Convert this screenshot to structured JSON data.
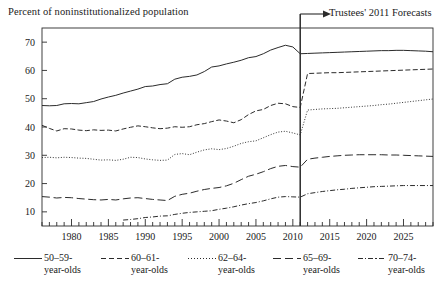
{
  "chart_data": {
    "type": "line",
    "title": "Percent of noninstitutionalized population",
    "xlabel": "",
    "ylabel": "Percent of noninstitutionalized population",
    "xlim": [
      1976,
      2029
    ],
    "ylim": [
      5,
      75
    ],
    "yticks": [
      10,
      20,
      30,
      40,
      50,
      60,
      70
    ],
    "xticks": [
      1980,
      1985,
      1990,
      1995,
      2000,
      2005,
      2010,
      2015,
      2020,
      2025
    ],
    "minor_xtick_interval": 1,
    "grid": false,
    "legend_position": "below",
    "annotations": [
      {
        "text": "Trustees' 2011 Forecasts",
        "x": 2011,
        "type": "arrow-right",
        "target_x": 2011
      }
    ],
    "forecast_divider_x": 2011,
    "series": [
      {
        "name": "50–59-year-olds",
        "label_line1": "50–59-",
        "label_line2": "year-olds",
        "style": "solid",
        "x": [
          1976,
          1977,
          1978,
          1979,
          1980,
          1981,
          1982,
          1983,
          1984,
          1985,
          1986,
          1987,
          1988,
          1989,
          1990,
          1991,
          1992,
          1993,
          1994,
          1995,
          1996,
          1997,
          1998,
          1999,
          2000,
          2001,
          2002,
          2003,
          2004,
          2005,
          2006,
          2007,
          2008,
          2009,
          2010,
          2011,
          2012,
          2013,
          2014,
          2015,
          2016,
          2017,
          2018,
          2019,
          2020,
          2021,
          2022,
          2023,
          2024,
          2025,
          2026,
          2027,
          2028,
          2029
        ],
        "y": [
          47.6,
          47.5,
          47.6,
          48.2,
          48.3,
          48.2,
          48.6,
          49.0,
          49.9,
          50.6,
          51.2,
          52.0,
          52.7,
          53.4,
          54.3,
          54.5,
          55.0,
          55.3,
          56.9,
          57.6,
          57.9,
          58.4,
          59.6,
          61.2,
          61.6,
          62.3,
          62.9,
          63.6,
          64.5,
          64.9,
          65.9,
          67.2,
          68.1,
          68.9,
          68.3,
          65.9,
          66.0,
          66.1,
          66.2,
          66.3,
          66.4,
          66.5,
          66.6,
          66.7,
          66.8,
          66.9,
          67.0,
          67.0,
          67.1,
          67.1,
          67.0,
          66.9,
          66.8,
          66.6
        ]
      },
      {
        "name": "60–61-year-olds",
        "label_line1": "60–61-",
        "label_line2": "year-olds",
        "style": "dashed",
        "x": [
          1976,
          1977,
          1978,
          1979,
          1980,
          1981,
          1982,
          1983,
          1984,
          1985,
          1986,
          1987,
          1988,
          1989,
          1990,
          1991,
          1992,
          1993,
          1994,
          1995,
          1996,
          1997,
          1998,
          1999,
          2000,
          2001,
          2002,
          2003,
          2004,
          2005,
          2006,
          2007,
          2008,
          2009,
          2010,
          2011,
          2012,
          2013,
          2014,
          2015,
          2016,
          2017,
          2018,
          2019,
          2020,
          2021,
          2022,
          2023,
          2024,
          2025,
          2026,
          2027,
          2028,
          2029
        ],
        "y": [
          40.6,
          39.5,
          38.6,
          39.4,
          39.3,
          38.9,
          38.7,
          39.0,
          38.8,
          38.9,
          38.6,
          39.3,
          39.9,
          40.4,
          40.1,
          39.7,
          39.4,
          39.6,
          40.1,
          39.9,
          40.1,
          40.8,
          41.2,
          41.9,
          42.5,
          42.1,
          41.5,
          42.6,
          44.4,
          45.7,
          46.2,
          47.6,
          48.4,
          48.2,
          47.2,
          46.9,
          58.9,
          59.0,
          59.1,
          59.2,
          59.2,
          59.3,
          59.4,
          59.5,
          59.6,
          59.7,
          59.8,
          59.9,
          60.0,
          60.1,
          60.2,
          60.3,
          60.4,
          60.5
        ]
      },
      {
        "name": "62–64-year-olds",
        "label_line1": "62–64-",
        "label_line2": "year-olds",
        "style": "dotted",
        "x": [
          1976,
          1977,
          1978,
          1979,
          1980,
          1981,
          1982,
          1983,
          1984,
          1985,
          1986,
          1987,
          1988,
          1989,
          1990,
          1991,
          1992,
          1993,
          1994,
          1995,
          1996,
          1997,
          1998,
          1999,
          2000,
          2001,
          2002,
          2003,
          2004,
          2005,
          2006,
          2007,
          2008,
          2009,
          2010,
          2011,
          2012,
          2013,
          2014,
          2015,
          2016,
          2017,
          2018,
          2019,
          2020,
          2021,
          2022,
          2023,
          2024,
          2025,
          2026,
          2027,
          2028,
          2029
        ],
        "y": [
          29.2,
          29.3,
          29.1,
          29.3,
          29.2,
          29.0,
          28.9,
          28.6,
          28.3,
          28.4,
          28.2,
          28.6,
          29.3,
          29.2,
          28.7,
          28.4,
          28.2,
          28.3,
          30.3,
          30.6,
          30.2,
          31.1,
          31.9,
          32.3,
          32.0,
          32.4,
          33.2,
          34.2,
          34.8,
          35.1,
          36.2,
          37.3,
          38.2,
          38.5,
          37.9,
          37.2,
          46.0,
          46.2,
          46.4,
          46.5,
          46.6,
          46.8,
          47.0,
          47.2,
          47.4,
          47.6,
          47.9,
          48.1,
          48.4,
          48.7,
          49.0,
          49.3,
          49.6,
          49.9
        ]
      },
      {
        "name": "65–69-year-olds",
        "label_line1": "65–69-",
        "label_line2": "year-olds",
        "style": "longdash",
        "x": [
          1976,
          1977,
          1978,
          1979,
          1980,
          1981,
          1982,
          1983,
          1984,
          1985,
          1986,
          1987,
          1988,
          1989,
          1990,
          1991,
          1992,
          1993,
          1994,
          1995,
          1996,
          1997,
          1998,
          1999,
          2000,
          2001,
          2002,
          2003,
          2004,
          2005,
          2006,
          2007,
          2008,
          2009,
          2010,
          2011,
          2012,
          2013,
          2014,
          2015,
          2016,
          2017,
          2018,
          2019,
          2020,
          2021,
          2022,
          2023,
          2024,
          2025,
          2026,
          2027,
          2028,
          2029
        ],
        "y": [
          15.4,
          15.2,
          14.9,
          15.1,
          15.0,
          14.7,
          14.5,
          14.3,
          14.2,
          14.4,
          14.2,
          14.6,
          14.9,
          15.0,
          14.7,
          14.4,
          14.2,
          14.0,
          15.5,
          16.2,
          16.6,
          17.3,
          17.9,
          18.3,
          18.6,
          19.2,
          20.1,
          21.4,
          22.6,
          23.3,
          24.2,
          25.3,
          26.1,
          26.4,
          26.0,
          25.8,
          28.6,
          29.0,
          29.3,
          29.6,
          29.8,
          30.0,
          30.1,
          30.2,
          30.2,
          30.2,
          30.2,
          30.1,
          30.1,
          30.0,
          29.9,
          29.8,
          29.7,
          29.6
        ]
      },
      {
        "name": "70–74-year-olds",
        "label_line1": "70–74-",
        "label_line2": "year-olds",
        "style": "dashdot",
        "x": [
          1987,
          1988,
          1989,
          1990,
          1991,
          1992,
          1993,
          1994,
          1995,
          1996,
          1997,
          1998,
          1999,
          2000,
          2001,
          2002,
          2003,
          2004,
          2005,
          2006,
          2007,
          2008,
          2009,
          2010,
          2011,
          2012,
          2013,
          2014,
          2015,
          2016,
          2017,
          2018,
          2019,
          2020,
          2021,
          2022,
          2023,
          2024,
          2025,
          2026,
          2027,
          2028,
          2029
        ],
        "y": [
          7.1,
          7.3,
          7.6,
          8.0,
          8.2,
          8.5,
          8.6,
          9.1,
          9.5,
          9.8,
          10.0,
          10.2,
          10.4,
          10.9,
          11.3,
          11.8,
          12.4,
          12.9,
          13.3,
          13.9,
          14.6,
          15.2,
          15.4,
          15.3,
          15.2,
          16.4,
          16.8,
          17.2,
          17.5,
          17.8,
          18.0,
          18.3,
          18.5,
          18.7,
          18.9,
          19.0,
          19.1,
          19.2,
          19.3,
          19.3,
          19.3,
          19.3,
          19.3
        ]
      }
    ]
  },
  "annotation": {
    "forecast_label": "Trustees' 2011 Forecasts"
  },
  "axis": {
    "y_title": "Percent of noninstitutionalized population",
    "y_tick_labels": [
      "70",
      "60",
      "50",
      "40",
      "30",
      "20",
      "10"
    ],
    "x_tick_labels": [
      "1980",
      "1985",
      "1990",
      "1995",
      "2000",
      "2005",
      "2010",
      "2015",
      "2020",
      "2025"
    ]
  },
  "legend": {
    "items": [
      {
        "line1": "50–59-",
        "line2": "year-olds",
        "style": "solid"
      },
      {
        "line1": "60–61-",
        "line2": "year-olds",
        "style": "dashed"
      },
      {
        "line1": "62–64-",
        "line2": "year-olds",
        "style": "dotted"
      },
      {
        "line1": "65–69-",
        "line2": "year-olds",
        "style": "longdash"
      },
      {
        "line1": "70–74-",
        "line2": "year-olds",
        "style": "dashdot"
      }
    ]
  }
}
